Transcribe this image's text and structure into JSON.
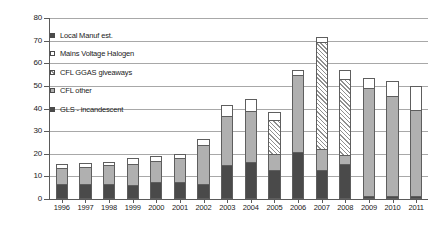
{
  "chart_data": {
    "type": "bar",
    "subtype": "stacked-bar",
    "title": "",
    "xlabel": "",
    "ylabel": "",
    "ylim": [
      0,
      80
    ],
    "ytick_step": 10,
    "yticks": [
      0,
      10,
      20,
      30,
      40,
      50,
      60,
      70,
      80
    ],
    "grid": true,
    "grid_axis": "y",
    "legend_position": "inside-upper-left",
    "categories": [
      "1996",
      "1997",
      "1998",
      "1999",
      "2000",
      "2001",
      "2002",
      "2003",
      "2004",
      "2005",
      "2006",
      "2007",
      "2008",
      "2009",
      "2010",
      "2011"
    ],
    "series": [
      {
        "name": "GLS - incandescent",
        "swatch": "dark-gray",
        "color": "#4a4a4a",
        "values": [
          6.5,
          6.5,
          6.5,
          6.0,
          7.5,
          7.5,
          6.5,
          15.0,
          16.5,
          13.0,
          21.0,
          13.0,
          15.5,
          1.5,
          1.5,
          1.5
        ]
      },
      {
        "name": "CFL other",
        "swatch": "medium-gray",
        "color": "#b0b0b0",
        "values": [
          7.0,
          7.5,
          8.5,
          9.5,
          9.5,
          10.5,
          17.5,
          21.5,
          22.5,
          7.0,
          34.0,
          9.0,
          4.0,
          47.5,
          44.0,
          38.0
        ]
      },
      {
        "name": "CFL GGAS giveaways",
        "swatch": "hatched",
        "color": "#ffffff",
        "pattern": "diagonal-hatch",
        "values": [
          0,
          0,
          0,
          0,
          0,
          0,
          0,
          0,
          0,
          15.0,
          0,
          47.5,
          33.5,
          0,
          0,
          0
        ]
      },
      {
        "name": "Mains Voltage Halogen",
        "swatch": "white",
        "color": "#ffffff",
        "values": [
          2.0,
          2.0,
          1.5,
          2.5,
          2.0,
          2.0,
          2.5,
          5.0,
          5.0,
          3.5,
          2.0,
          2.0,
          4.0,
          4.5,
          6.5,
          10.5
        ]
      },
      {
        "name": "Local Manuf est.",
        "swatch": "dark-gray",
        "color": "#4a4a4a",
        "values": [
          0,
          0,
          0,
          0,
          0,
          0,
          0,
          0,
          0,
          0,
          0,
          0,
          0,
          0,
          0,
          0
        ]
      }
    ],
    "totals": [
      15.5,
      16.0,
      16.5,
      18.0,
      19.0,
      20.0,
      26.5,
      41.5,
      44.0,
      38.5,
      57.0,
      71.5,
      57.0,
      53.5,
      52.0,
      50.0
    ]
  },
  "legend": {
    "items": [
      {
        "label": "Local Manuf est.",
        "swatch": "dark-gray"
      },
      {
        "label": "Mains Voltage Halogen",
        "swatch": "white"
      },
      {
        "label": "CFL GGAS giveaways",
        "swatch": "hatched"
      },
      {
        "label": "CFL other",
        "swatch": "medium-gray"
      },
      {
        "label": "GLS - incandescent",
        "swatch": "dark-gray"
      }
    ]
  },
  "axis": {
    "y_labels": [
      "80",
      "70",
      "60",
      "50",
      "40",
      "30",
      "20",
      "10",
      "0"
    ],
    "x_labels": [
      "1996",
      "1997",
      "1998",
      "1999",
      "2000",
      "2001",
      "2002",
      "2003",
      "2004",
      "2005",
      "2006",
      "2007",
      "2008",
      "2009",
      "2010",
      "2011"
    ]
  }
}
